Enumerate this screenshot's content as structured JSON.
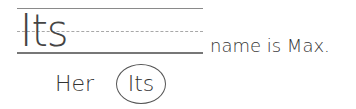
{
  "worksheet": {
    "answer_word": "Its",
    "sentence_rest": "name is Max.",
    "choices": [
      {
        "label": "Her",
        "circled": false
      },
      {
        "label": "Its",
        "circled": true
      }
    ]
  }
}
